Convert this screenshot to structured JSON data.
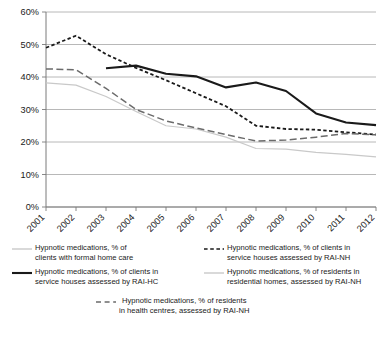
{
  "chart_data": {
    "type": "line",
    "title": "",
    "xlabel": "",
    "ylabel": "",
    "x": [
      2001,
      2002,
      2003,
      2004,
      2005,
      2006,
      2007,
      2008,
      2009,
      2010,
      2011,
      2012
    ],
    "xtick_labels": [
      "2001",
      "2002",
      "2003",
      "2004",
      "2005",
      "2006",
      "2007",
      "2008",
      "2009",
      "2010",
      "2011",
      "2012"
    ],
    "ylim": [
      0,
      60
    ],
    "ytick_labels": [
      "0%",
      "10%",
      "20%",
      "30%",
      "40%",
      "50%",
      "60%"
    ],
    "ytick_values": [
      0,
      10,
      20,
      30,
      40,
      50,
      60
    ],
    "grid": true,
    "legend_position": "below",
    "series": [
      {
        "name": "Hypnotic medications, % of clients with formal home care",
        "style": "solid",
        "color": "#c9c9c9",
        "width": 1.2,
        "x": [
          2001,
          2002,
          2003,
          2004,
          2005,
          2006,
          2007,
          2008,
          2009,
          2010,
          2011,
          2012
        ],
        "values": [
          38.2,
          37.5,
          34.0,
          29.4,
          25.0,
          24.0,
          21.5,
          18.0,
          17.8,
          16.8,
          16.2,
          15.4
        ]
      },
      {
        "name": "Hypnotic medications, % of clients in service houses assessed by RAI-HC",
        "style": "solid",
        "color": "#1a1a1a",
        "width": 2.1,
        "x": [
          2003,
          2004,
          2005,
          2006,
          2007,
          2008,
          2009,
          2010,
          2011,
          2012
        ],
        "values": [
          42.7,
          43.5,
          41.0,
          40.2,
          36.8,
          38.3,
          35.7,
          28.8,
          26.0,
          25.2
        ]
      },
      {
        "name": "Hypnotic medications, % of clients in service houses assessed by RAI-NH",
        "style": "dotted",
        "color": "#1a1a1a",
        "width": 1.8,
        "x": [
          2001,
          2002,
          2003,
          2004,
          2005,
          2006,
          2007,
          2008,
          2009,
          2010,
          2011,
          2012
        ],
        "values": [
          49.0,
          52.7,
          47.0,
          42.8,
          39.0,
          35.0,
          31.0,
          25.0,
          24.0,
          23.8,
          23.0,
          22.3
        ]
      },
      {
        "name": "Hypnotic medications, % of residents in residential homes, assessed by RAI-NH",
        "style": "solid",
        "color": "#c9c9c9",
        "width": 1.2,
        "x": [],
        "values": []
      },
      {
        "name": "Hypnotic medications, % of residents in health centres, assessed by RAI-NH",
        "style": "dashed",
        "color": "#6b6b6b",
        "width": 1.5,
        "x": [
          2001,
          2002,
          2003,
          2004,
          2005,
          2006,
          2007,
          2008,
          2009,
          2010,
          2011,
          2012
        ],
        "values": [
          42.5,
          42.2,
          36.5,
          30.0,
          26.5,
          24.3,
          22.3,
          20.3,
          20.6,
          21.5,
          22.6,
          22.2
        ]
      }
    ]
  },
  "legend": {
    "items": [
      {
        "id": "clients-formal-home-care",
        "label": "Hypnotic medications, % of\nclients with formal home care",
        "style": "solid",
        "color": "#c9c9c9"
      },
      {
        "id": "service-houses-rai-nh",
        "label": "Hypnotic medications, % of clients in\nservice houses assessed by RAI-NH",
        "style": "dashed-short",
        "color": "#1a1a1a"
      },
      {
        "id": "service-houses-rai-hc",
        "label": "Hypnotic medications, % of clients in\nservice houses assessed by RAI-HC",
        "style": "solid",
        "color": "#1a1a1a"
      },
      {
        "id": "residential-homes-rai-nh",
        "label": "Hypnotic medications, % of residents in\nresidential homes, assessed by RAI-NH",
        "style": "solid",
        "color": "#c9c9c9"
      },
      {
        "id": "health-centres-rai-nh",
        "label": "Hypnotic medications, % of residents\nin health centres, assessed by RAI-NH",
        "style": "dashed-long",
        "color": "#6b6b6b"
      }
    ]
  }
}
